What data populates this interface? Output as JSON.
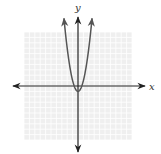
{
  "chart_data": {
    "type": "line",
    "title": "",
    "xlabel": "x",
    "ylabel": "y",
    "grid": true,
    "xlim": [
      -10,
      10
    ],
    "ylim": [
      -10,
      10
    ],
    "axis_arrows": true,
    "series": [
      {
        "name": "parabola",
        "equation": "y = 2x^2 - 1",
        "vertex": [
          0,
          -1
        ],
        "opens": "up",
        "end_arrows": true,
        "x": [
          -2.6,
          -2,
          -1.5,
          -1,
          -0.5,
          0,
          0.5,
          1,
          1.5,
          2,
          2.6
        ],
        "y": [
          12.5,
          7,
          3.5,
          1,
          -0.5,
          -1,
          -0.5,
          1,
          3.5,
          7,
          12.5
        ]
      }
    ]
  },
  "labels": {
    "x_axis": "x",
    "y_axis": "y"
  },
  "colors": {
    "grid": "#d9d9d9",
    "grid_bg": "#efefef",
    "axis": "#222222",
    "curve": "#555555"
  }
}
